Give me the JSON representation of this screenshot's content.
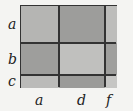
{
  "diagram": {
    "row_labels": [
      "a",
      "b",
      "c"
    ],
    "col_labels": [
      "a",
      "d",
      "f"
    ],
    "cells": [
      {
        "row": 0,
        "col": 0,
        "color": "#b5b5b3"
      },
      {
        "row": 0,
        "col": 1,
        "color": "#9d9d9b"
      },
      {
        "row": 0,
        "col": 2,
        "color": "#bdbdbb"
      },
      {
        "row": 1,
        "col": 0,
        "color": "#9e9e9c"
      },
      {
        "row": 1,
        "col": 1,
        "color": "#c0c0be"
      },
      {
        "row": 1,
        "col": 2,
        "color": "#9f9f9d"
      },
      {
        "row": 2,
        "col": 0,
        "color": "#bbbbb9"
      },
      {
        "row": 2,
        "col": 1,
        "color": "#9b9b99"
      },
      {
        "row": 2,
        "col": 2,
        "color": "#c6c6c4"
      }
    ]
  }
}
